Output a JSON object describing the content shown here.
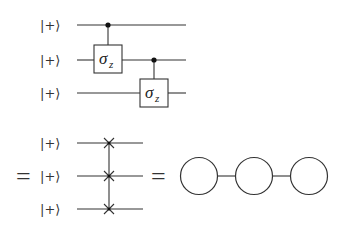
{
  "top_circuit": {
    "inputs": [
      "|+⟩",
      "|+⟩",
      "|+⟩"
    ],
    "gates": [
      {
        "type": "controlled",
        "control_qubit": 0,
        "target_qubit": 1,
        "label": "σ",
        "subscript": "z"
      },
      {
        "type": "controlled",
        "control_qubit": 1,
        "target_qubit": 2,
        "label": "σ",
        "subscript": "z"
      }
    ]
  },
  "equals_1": "=",
  "bottom_circuit": {
    "inputs": [
      "|+⟩",
      "|+⟩",
      "|+⟩"
    ],
    "gate": {
      "type": "multi-qubit cross connector",
      "qubits": [
        0,
        1,
        2
      ]
    }
  },
  "equals_2": "=",
  "graph_state": {
    "nodes": [
      "node-1",
      "node-2",
      "node-3"
    ],
    "edges": [
      [
        "node-1",
        "node-2"
      ],
      [
        "node-2",
        "node-3"
      ]
    ]
  }
}
